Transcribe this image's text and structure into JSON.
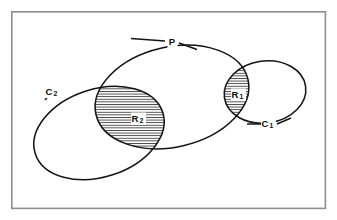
{
  "figure": {
    "kind": "venn-intersection-diagram",
    "background_color": "#ffffff",
    "frame": {
      "name": "outer-frame",
      "stroke_color": "#8d8d8d",
      "x": 11,
      "y": 11,
      "width": 315,
      "height": 198
    },
    "stroke_color": "#141414",
    "hatch": {
      "orientation": "horizontal",
      "spacing_px": 2.6,
      "stroke_color": "#141414",
      "stroke_width": 0.75
    }
  },
  "sets": [
    {
      "id": "P",
      "label": "P",
      "role": "large-enclosing-ellipse",
      "label_x": 172,
      "label_y": 42,
      "cx": 172,
      "cy": 97,
      "rx": 78,
      "ry": 50,
      "rotation_deg": -13
    },
    {
      "id": "C2",
      "label": "C",
      "subscript": "2",
      "role": "left-ellipse",
      "label_x": 52,
      "label_y": 92,
      "cx": 99,
      "cy": 133,
      "rx": 67,
      "ry": 44,
      "rotation_deg": -18
    },
    {
      "id": "C1",
      "label": "C",
      "subscript": "1",
      "role": "right-small-ellipse",
      "label_x": 268,
      "label_y": 124,
      "cx": 265,
      "cy": 92,
      "rx": 41,
      "ry": 31,
      "rotation_deg": -8
    }
  ],
  "regions": [
    {
      "id": "R2",
      "label": "R",
      "subscript": "2",
      "description": "intersection of P and C2",
      "hatched": true,
      "label_x": 138,
      "label_y": 119
    },
    {
      "id": "R1",
      "label": "R",
      "subscript": "1",
      "description": "intersection of P and C1",
      "hatched": true,
      "label_x": 238,
      "label_y": 95
    }
  ],
  "leaders": [
    {
      "id": "leader-P-left",
      "x1": 131,
      "y1": 38,
      "x2": 165,
      "y2": 41
    },
    {
      "id": "leader-P-right",
      "x1": 179,
      "y1": 43,
      "x2": 196,
      "y2": 49
    },
    {
      "id": "leader-C2",
      "x1": 45,
      "y1": 99,
      "x2": 57,
      "y2": 86
    },
    {
      "id": "leader-C1-left",
      "x1": 247,
      "y1": 124,
      "x2": 261,
      "y2": 124
    },
    {
      "id": "leader-C1-right",
      "x1": 276,
      "y1": 124,
      "x2": 290,
      "y2": 118
    }
  ]
}
